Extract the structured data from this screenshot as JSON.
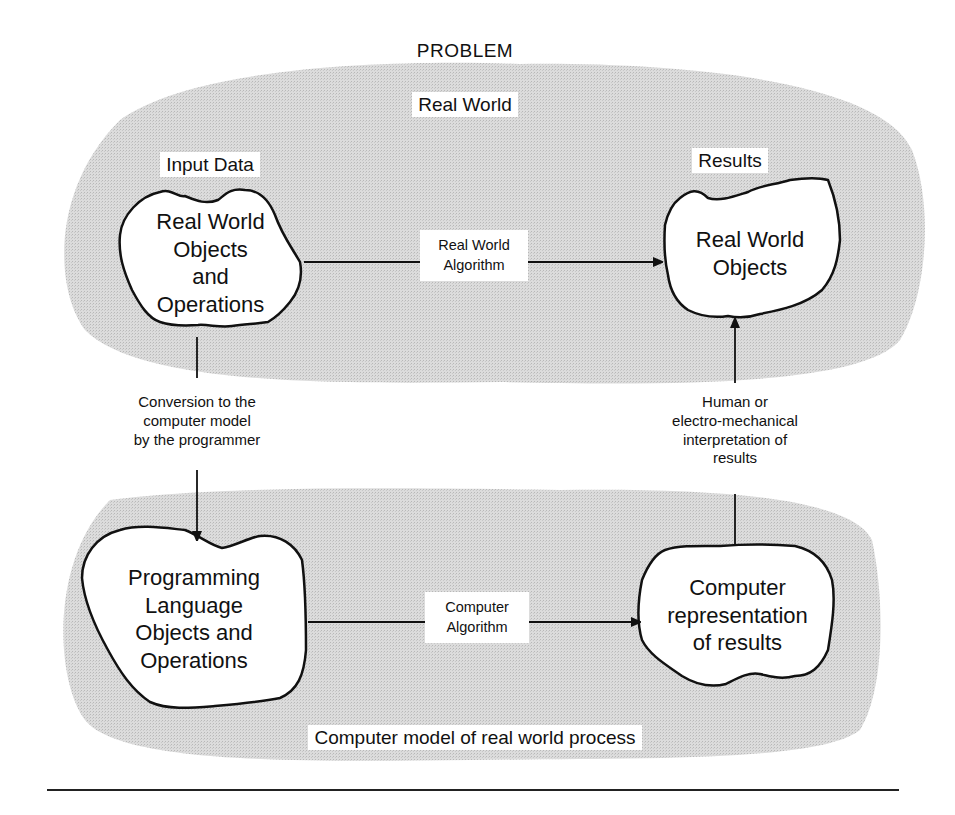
{
  "diagram": {
    "title": "PROBLEM",
    "regions": {
      "real_world": {
        "label": "Real World",
        "fill": "#d9d9d9"
      },
      "computer_model": {
        "label": "Computer model of real world process",
        "fill": "#d9d9d9"
      }
    },
    "labels": {
      "input_data": "Input Data",
      "results": "Results"
    },
    "nodes": {
      "real_world_input": {
        "lines": [
          "Real World",
          "Objects",
          "and",
          "Operations"
        ]
      },
      "real_world_output": {
        "lines": [
          "Real World",
          "Objects"
        ]
      },
      "programming_language": {
        "lines": [
          "Programming",
          "Language",
          "Objects and",
          "Operations"
        ]
      },
      "computer_results": {
        "lines": [
          "Computer",
          "representation",
          "of results"
        ]
      }
    },
    "edges": {
      "real_world_algorithm": {
        "lines": [
          "Real World",
          "Algorithm"
        ]
      },
      "computer_algorithm": {
        "lines": [
          "Computer",
          "Algorithm"
        ]
      },
      "conversion": {
        "lines": [
          "Conversion to the",
          "computer model",
          "by the programmer"
        ]
      },
      "interpretation": {
        "lines": [
          "Human or",
          "electro-mechanical",
          "interpretation of",
          "results"
        ]
      }
    }
  }
}
